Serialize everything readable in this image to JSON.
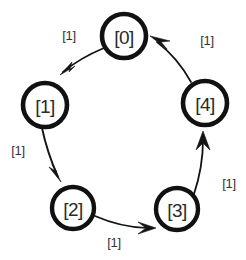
{
  "figure": {
    "background_color": "#ffffff",
    "stroke_color": "#141414",
    "text_color": "#2a2a2a",
    "width": 246,
    "height": 260
  },
  "graph": {
    "type": "directed-cycle",
    "node_count": 5,
    "edge_count": 5,
    "node_shape": "circle",
    "node_radius": 22,
    "node_stroke_width": 4.5,
    "nodes": [
      {
        "id": "n0",
        "label": "[0]",
        "cx": 124,
        "cy": 36,
        "r": 22
      },
      {
        "id": "n1",
        "label": "[1]",
        "cx": 45,
        "cy": 105,
        "r": 22
      },
      {
        "id": "n2",
        "label": "[2]",
        "cx": 73,
        "cy": 208,
        "r": 21
      },
      {
        "id": "n3",
        "label": "[3]",
        "cx": 177,
        "cy": 209,
        "r": 21
      },
      {
        "id": "n4",
        "label": "[4]",
        "cx": 205,
        "cy": 103,
        "r": 22
      }
    ],
    "edges": [
      {
        "id": "e0",
        "from": "n0",
        "to": "n1",
        "weight": "[1]",
        "path": "M 104 48 Q 80 58 63 72",
        "arrow": "60,75 75,66 69,72 72,62",
        "label_x": 69,
        "label_y": 35
      },
      {
        "id": "e1",
        "from": "n1",
        "to": "n2",
        "weight": "[1]",
        "path": "M 42 128 Q 47 152 58 177",
        "arrow": "61,182 49,167 57,172 52,164",
        "label_x": 18,
        "label_y": 150
      },
      {
        "id": "e2",
        "from": "n2",
        "to": "n3",
        "weight": "[1]",
        "path": "M 95 216 Q 120 227 147 228",
        "arrow": "156,228 138,234 146,228 138,222",
        "label_x": 114,
        "label_y": 242
      },
      {
        "id": "e3",
        "from": "n3",
        "to": "n4",
        "weight": "[1]",
        "path": "M 194 194 Q 203 167 203 140",
        "arrow": "203,131 196,150 203,143 210,150",
        "label_x": 229,
        "label_y": 183
      },
      {
        "id": "e4",
        "from": "n4",
        "to": "n0",
        "weight": "[1]",
        "path": "M 191 82 Q 177 57 157 42",
        "arrow": "150,36 170,41 161,42 167,49",
        "label_x": 207,
        "label_y": 40
      }
    ]
  }
}
